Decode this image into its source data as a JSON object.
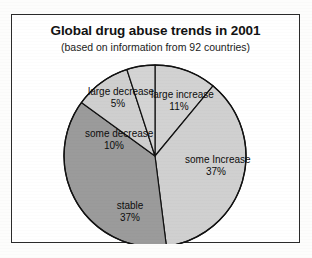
{
  "figure": {
    "title": "Global drug abuse trends in 2001",
    "subtitle": "(based on information from 92 countries)"
  },
  "chart_data": {
    "type": "pie",
    "title": "Global drug abuse trends in 2001",
    "subtitle": "(based on information from 92 countries)",
    "xlabel": "",
    "ylabel": "",
    "units": "percent",
    "total": 100,
    "legend": "none",
    "grid": false,
    "start_angle_deg": 0,
    "direction": "clockwise",
    "categories": [
      "large increase",
      "some Increase",
      "stable",
      "some decrease",
      "large decrease"
    ],
    "values": [
      11,
      37,
      37,
      10,
      5
    ],
    "labels": [
      "11%",
      "37%",
      "37%",
      "10%",
      "5%"
    ],
    "colors": [
      "#d2d2d2",
      "#d0d0d0",
      "#9b9b9b",
      "#cfcfcf",
      "#d4d4d4"
    ],
    "slices": [
      {
        "name": "large increase",
        "value": 11,
        "label": "11%",
        "color": "#d2d2d2"
      },
      {
        "name": "some Increase",
        "value": 37,
        "label": "37%",
        "color": "#d0d0d0"
      },
      {
        "name": "stable",
        "value": 37,
        "label": "37%",
        "color": "#9b9b9b"
      },
      {
        "name": "some decrease",
        "value": 10,
        "label": "10%",
        "color": "#cfcfcf"
      },
      {
        "name": "large decrease",
        "value": 5,
        "label": "5%",
        "color": "#d4d4d4"
      }
    ]
  },
  "style": {
    "frame_color": "#2b2b2b",
    "slice_outline": "#111111",
    "page_background": "#ffffff",
    "text_color": "#0d0d0d"
  }
}
